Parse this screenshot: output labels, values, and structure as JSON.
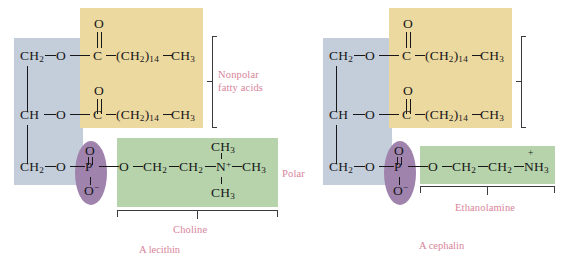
{
  "figure": {
    "background": "#ffffff"
  },
  "colors": {
    "glycerol_backbone": "#c3ceda",
    "fatty_acid": "#ecd9a0",
    "head_group": "#b6d3ab",
    "phosphate_oval": "#9f83ad",
    "annotation_text": "#d8849a",
    "structure_text": "#17171a"
  },
  "left_structure": {
    "caption": "A lecithin",
    "head_group_name": "Choline",
    "glycerol": {
      "c1": "CH",
      "c1_sub": "2",
      "c2": "CH",
      "c3": "CH",
      "c3_sub": "2",
      "o": "O"
    },
    "fatty_acid_1": {
      "carbonyl_o": "O",
      "carbonyl_c": "C",
      "chain": "(CH",
      "chain_sub": "2",
      "chain_n": ")",
      "chain_count": "14",
      "terminal": "CH",
      "terminal_sub": "3"
    },
    "fatty_acid_2": {
      "carbonyl_o": "O",
      "carbonyl_c": "C",
      "chain": "(CH",
      "chain_sub": "2",
      "chain_n": ")",
      "chain_count": "14",
      "terminal": "CH",
      "terminal_sub": "3"
    },
    "phosphate": {
      "top_o": "O",
      "p": "P",
      "bottom_o": "O",
      "bottom_charge": "−"
    },
    "choline": {
      "ester_o": "O",
      "ch2_a": "CH",
      "ch2_a_sub": "2",
      "ch2_b": "CH",
      "ch2_b_sub": "2",
      "n": "N",
      "n_charge": "+",
      "methyl_top": "CH",
      "methyl_top_sub": "3",
      "methyl_right": "CH",
      "methyl_right_sub": "3",
      "methyl_bottom": "CH",
      "methyl_bottom_sub": "3"
    }
  },
  "right_structure": {
    "caption": "A cephalin",
    "head_group_name": "Ethanolamine",
    "glycerol": {
      "c1": "CH",
      "c1_sub": "2",
      "c2": "CH",
      "c3": "CH",
      "c3_sub": "2",
      "o": "O"
    },
    "fatty_acid_1": {
      "carbonyl_o": "O",
      "carbonyl_c": "C",
      "chain": "(CH",
      "chain_sub": "2",
      "chain_n": ")",
      "chain_count": "14",
      "terminal": "CH",
      "terminal_sub": "3"
    },
    "fatty_acid_2": {
      "carbonyl_o": "O",
      "carbonyl_c": "C",
      "chain": "(CH",
      "chain_sub": "2",
      "chain_n": ")",
      "chain_count": "14",
      "terminal": "CH",
      "terminal_sub": "3"
    },
    "phosphate": {
      "top_o": "O",
      "p": "P",
      "bottom_o": "O",
      "bottom_charge": "−"
    },
    "ethanolamine": {
      "ester_o": "O",
      "ch2_a": "CH",
      "ch2_a_sub": "2",
      "ch2_b": "CH",
      "ch2_b_sub": "2",
      "nh3": "NH",
      "nh3_sub": "3",
      "nh3_charge": "+"
    }
  },
  "annotations": {
    "nonpolar_line1": "Nonpolar",
    "nonpolar_line2": "fatty acids",
    "polar": "Polar"
  }
}
